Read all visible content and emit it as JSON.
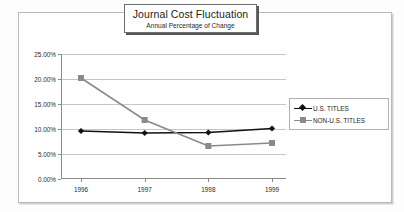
{
  "chart_data": {
    "type": "line",
    "title": "Journal Cost Fluctuation",
    "subtitle": "Annual Percentage of Change",
    "xlabel": "",
    "ylabel": "",
    "categories": [
      "1996",
      "1997",
      "1998",
      "1999"
    ],
    "series": [
      {
        "name": "U.S. TITLES",
        "values": [
          9.6,
          9.2,
          9.3,
          10.1
        ],
        "color": "#111111",
        "marker": "diamond"
      },
      {
        "name": "NON-U.S. TITLES",
        "values": [
          20.2,
          11.8,
          6.6,
          7.2
        ],
        "color": "#8a8a8a",
        "marker": "square"
      }
    ],
    "ylim": [
      0,
      25
    ],
    "ytick_values": [
      0,
      5,
      10,
      15,
      20,
      25
    ],
    "ytick_labels": [
      "0.00%",
      "5.00%",
      "10.00%",
      "15.00%",
      "20.00%",
      "25.00%"
    ],
    "grid": true,
    "legend_position": "right"
  },
  "legend": {
    "entries": [
      {
        "label": "U.S. TITLES"
      },
      {
        "label": "NON-U.S. TITLES"
      }
    ]
  },
  "colors": {
    "us_titles": "#111111",
    "non_us_titles": "#8a8a8a",
    "gridline": "#c6c6c6",
    "axis": "#8c8c8c",
    "frame": "#b9b9b9"
  }
}
